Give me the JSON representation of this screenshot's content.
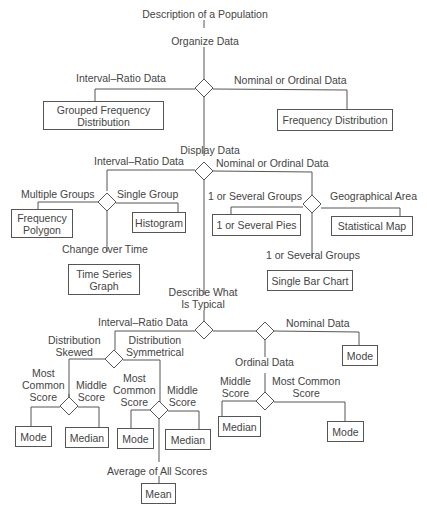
{
  "diagram": {
    "title": "Description of a Population",
    "stages": {
      "organize": "Organize Data",
      "display": "Display Data",
      "typical": "Describe What\nIs Typical"
    },
    "edges": {
      "interval_ratio": "Interval–Ratio Data",
      "nominal_or_ordinal": "Nominal or Ordinal Data",
      "multiple_groups": "Multiple Groups",
      "single_group": "Single Group",
      "change_over_time": "Change over Time",
      "one_or_several_groups": "1 or Several Groups",
      "geographical_area": "Geographical Area",
      "one_or_several_groups_2": "1 or Several Groups",
      "interval_ratio_2": "Interval–Ratio Data",
      "interval_ratio_3": "Interval–Ratio Data",
      "nominal_or_ordinal_2": "Nominal or Ordinal Data",
      "nominal_data": "Nominal Data",
      "ordinal_data": "Ordinal Data",
      "distribution_skewed": "Distribution\nSkewed",
      "distribution_symmetrical": "Distribution\nSymmetrical",
      "most_common_score_1": "Most\nCommon\nScore",
      "middle_score_1": "Middle\nScore",
      "most_common_score_2": "Most\nCommon\nScore",
      "middle_score_2": "Middle\nScore",
      "average_all_scores": "Average of All Scores",
      "middle_score_3": "Middle\nScore",
      "most_common_score_3": "Most Common\nScore"
    },
    "outputs": {
      "grouped_frequency_distribution": "Grouped Frequency\nDistribution",
      "frequency_distribution": "Frequency Distribution",
      "frequency_polygon": "Frequency\nPolygon",
      "histogram": "Histogram",
      "time_series_graph": "Time Series\nGraph",
      "pies": "1 or Several Pies",
      "statistical_map": "Statistical Map",
      "single_bar_chart": "Single Bar Chart",
      "mode_skewed": "Mode",
      "median_skewed": "Median",
      "mode_symmetrical": "Mode",
      "median_symmetrical": "Median",
      "mean": "Mean",
      "median_ordinal": "Median",
      "mode_ordinal": "Mode",
      "mode_nominal": "Mode"
    }
  }
}
